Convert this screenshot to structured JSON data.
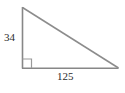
{
  "figure": {
    "name": "right-triangle-diagram",
    "type": "geometry-diagram",
    "background_color": "#ffffff",
    "stroke_color": "#878787",
    "text_color": "#2b2b2b",
    "shape": "right triangle",
    "vertices": {
      "top": [
        22,
        7
      ],
      "bottom_left": [
        22,
        68
      ],
      "bottom_right": [
        118,
        68
      ]
    },
    "right_angle_marker": {
      "name": "right-angle-square",
      "at_vertex": "bottom_left",
      "size": 9
    },
    "labels": {
      "vertical_leg": "34",
      "horizontal_leg": "125"
    },
    "sides": [
      {
        "name": "vertical-leg",
        "label": "34",
        "position": "left"
      },
      {
        "name": "horizontal-leg",
        "label": "125",
        "position": "bottom"
      },
      {
        "name": "hypotenuse",
        "label": "",
        "position": "diagonal"
      }
    ]
  }
}
